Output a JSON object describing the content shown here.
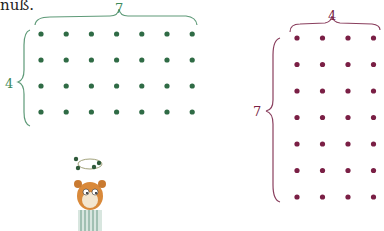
{
  "caption": "nuß.",
  "left_grid": {
    "columns": 7,
    "rows": 4,
    "top_label": "7",
    "side_label": "4",
    "color": "#2f6b45"
  },
  "right_grid": {
    "columns": 4,
    "rows": 7,
    "top_label": "4",
    "side_label": "7",
    "color": "#7a1f45"
  },
  "illustration": {
    "name": "hamster-juggling-dots"
  }
}
